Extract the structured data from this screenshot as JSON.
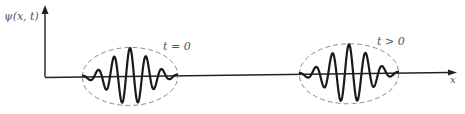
{
  "figure": {
    "type": "wave packet propagation diagram",
    "y_axis_label": "ψ(x, t)",
    "x_axis_label": "x",
    "packets": [
      {
        "label": "t = 0",
        "center_x": 130,
        "half_width": 48,
        "amplitude": 29,
        "cycles": 6,
        "label_x": 163,
        "label_y": 50
      },
      {
        "label": "t > 0",
        "center_x": 349,
        "half_width": 50,
        "amplitude": 30,
        "cycles": 6,
        "label_x": 377,
        "label_y": 45
      }
    ],
    "colors": {
      "wave": "#1a1a1a",
      "envelope": "#888888",
      "axis": "#222222",
      "label": "#555555"
    }
  }
}
